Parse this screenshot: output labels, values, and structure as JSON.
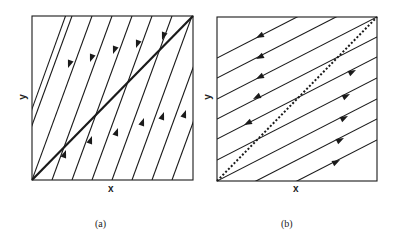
{
  "figure": {
    "panels": [
      {
        "id": "a",
        "caption": "(a)",
        "xlabel": "x",
        "ylabel": "y",
        "box": {
          "x0": 32,
          "y0": 16,
          "x1": 193,
          "y1": 180
        },
        "lines_description": "steep parallel trajectories; bold diagonal from bottom-left to top-right corner",
        "diagonal_style": "solid-bold",
        "arrow_direction_above_diagonal": "down-left",
        "arrow_direction_below_diagonal": "up-right"
      },
      {
        "id": "b",
        "caption": "(b)",
        "xlabel": "x",
        "ylabel": "y",
        "box": {
          "x0": 217,
          "y0": 17,
          "x1": 377,
          "y1": 181
        },
        "lines_description": "shallow parallel trajectories; dotted diagonal from bottom-left to top-right corner",
        "diagonal_style": "dotted-bold",
        "arrow_direction_above_diagonal": "left",
        "arrow_direction_below_diagonal": "right"
      }
    ],
    "colors": {
      "ink": "#1a1a1a",
      "background": "#ffffff"
    }
  }
}
